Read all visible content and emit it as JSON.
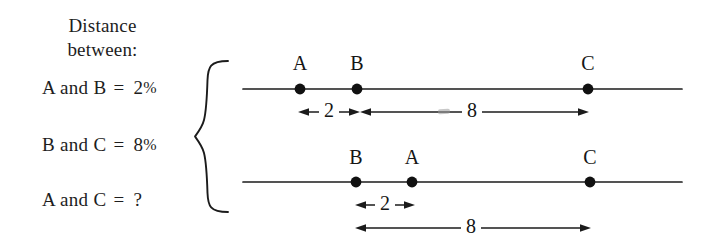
{
  "heading": {
    "line1": "Distance",
    "line2": "between:"
  },
  "equations": [
    {
      "id": "ab",
      "left": "A and B",
      "operator": "=",
      "value": "2",
      "unit": "%"
    },
    {
      "id": "bc",
      "left": "B and C",
      "operator": "=",
      "value": "8",
      "unit": "%"
    },
    {
      "id": "ac",
      "left": "A and C",
      "operator": "=",
      "value": "?",
      "unit": ""
    }
  ],
  "diagrams": [
    {
      "id": "case-1",
      "order": "A B C",
      "points": [
        {
          "label": "A",
          "x": 64
        },
        {
          "label": "B",
          "x": 121
        },
        {
          "label": "C",
          "x": 352
        }
      ],
      "measures": [
        {
          "label": "2",
          "from": 62,
          "to": 123
        },
        {
          "label": "8",
          "from": 124,
          "to": 352
        }
      ]
    },
    {
      "id": "case-2",
      "order": "B A C",
      "points": [
        {
          "label": "B",
          "x": 120
        },
        {
          "label": "A",
          "x": 176
        },
        {
          "label": "C",
          "x": 354
        }
      ],
      "measures": [
        {
          "label": "2",
          "from": 119,
          "to": 179
        },
        {
          "label": "8",
          "from": 119,
          "to": 354
        }
      ]
    }
  ],
  "colors": {
    "ink": "#1b1b1b",
    "paper": "#ffffff"
  }
}
